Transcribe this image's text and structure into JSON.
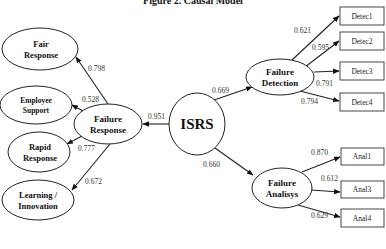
{
  "title": "Figure 2. Causal Model",
  "latent": {
    "isrs": {
      "line1": "ISRS",
      "line2": ""
    },
    "failure_response": {
      "line1": "Failure",
      "line2": "Response"
    },
    "failure_detection": {
      "line1": "Failure",
      "line2": "Detection"
    },
    "failure_analisys": {
      "line1": "Failure",
      "line2": "Analisys"
    },
    "fair_response": {
      "line1": "Fair",
      "line2": "Response"
    },
    "employee_support": {
      "line1": "Employee",
      "line2": "Support"
    },
    "rapid_response": {
      "line1": "Rapid",
      "line2": "Response"
    },
    "learning_innovation": {
      "line1": "Learning /",
      "line2": "Innovation"
    }
  },
  "indicators": {
    "detec1": "Detec1",
    "detec2": "Detec2",
    "detec3": "Detec3",
    "detec4": "Detec4",
    "anal1": "Anal1",
    "anal3": "Anal3",
    "anal4": "Anal4"
  },
  "paths": {
    "isrs_to_failure_response": "0.951",
    "isrs_to_failure_detection": "0.669",
    "isrs_to_failure_analisys": "0.660",
    "fr_to_fair_response": "0.798",
    "fr_to_employee_support": "0.528",
    "fr_to_rapid_response": "0.777",
    "fr_to_learning_innovation": "0.672",
    "fd_to_detec1": "0.621",
    "fd_to_detec2": "0.595",
    "fd_to_detec3": "0.791",
    "fd_to_detec4": "0.794",
    "fa_to_anal1": "0.870",
    "fa_to_anal3": "0.612",
    "fa_to_anal4": "0.629"
  }
}
